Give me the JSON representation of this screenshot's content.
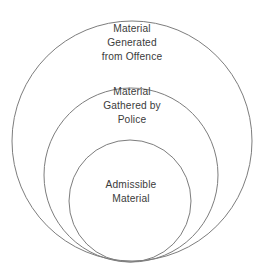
{
  "diagram": {
    "type": "nested-circles",
    "background_color": "#ffffff",
    "stroke_color": "#7d7d7d",
    "text_color": "#3b3b3b",
    "circles": [
      {
        "id": "outer",
        "label": "Material\nGenerated\nfrom Offence",
        "label_lines": [
          "Material",
          "Generated",
          "from Offence"
        ],
        "cx": 132,
        "cy": 141,
        "r": 120
      },
      {
        "id": "middle",
        "label": "Material\nGathered by\nPolice",
        "label_lines": [
          "Material",
          "Gathered by",
          "Police"
        ],
        "cx": 131,
        "cy": 175,
        "r": 87
      },
      {
        "id": "inner",
        "label": "Admissible\nMaterial",
        "label_lines": [
          "Admissible",
          "Material"
        ],
        "cx": 130,
        "cy": 201,
        "r": 61
      }
    ]
  }
}
